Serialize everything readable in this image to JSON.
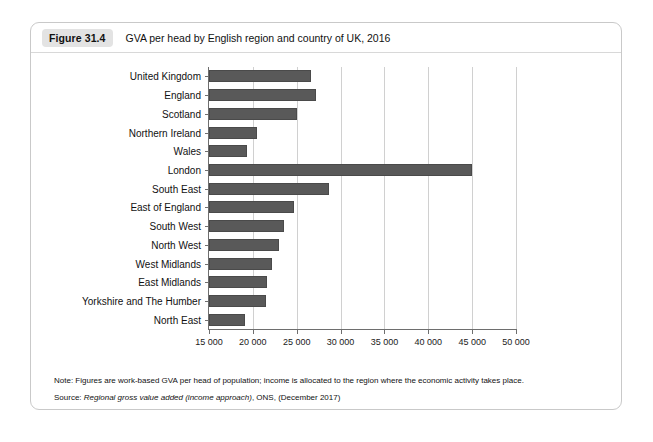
{
  "figure": {
    "badge": "Figure 31.4",
    "title": "GVA per head by English region and country of UK, 2016",
    "note": "Note: Figures are work-based GVA per head of population; income is allocated to the region where the economic activity takes place.",
    "source_prefix": "Source: ",
    "source_italic": "Regional gross value added (income approach)",
    "source_suffix": ", ONS, (December 2017)"
  },
  "chart_data": {
    "type": "bar",
    "orientation": "horizontal",
    "title": "GVA per head by English region and country of UK, 2016",
    "xlabel": "",
    "ylabel": "",
    "categories": [
      "United Kingdom",
      "England",
      "Scotland",
      "Northern Ireland",
      "Wales",
      "London",
      "South East",
      "East of England",
      "South West",
      "North West",
      "West Midlands",
      "East Midlands",
      "Yorkshire and The Humber",
      "North East"
    ],
    "values": [
      26600,
      27200,
      25000,
      20500,
      19300,
      45000,
      28700,
      24700,
      23500,
      23000,
      22200,
      21600,
      21500,
      19100
    ],
    "xlim": [
      15000,
      50000
    ],
    "xticks": [
      15000,
      20000,
      25000,
      30000,
      35000,
      40000,
      45000,
      50000
    ],
    "xticklabels": [
      "15 000",
      "20 000",
      "25 000",
      "30 000",
      "35 000",
      "40 000",
      "45 000",
      "50 000"
    ],
    "grid": "vertical",
    "legend": null,
    "bar_color": "#595959"
  }
}
